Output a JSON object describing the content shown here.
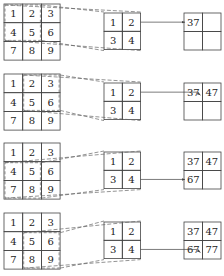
{
  "input_matrix": [
    [
      "1",
      "2",
      "3"
    ],
    [
      "4",
      "5",
      "6"
    ],
    [
      "7",
      "8",
      "9"
    ]
  ],
  "kernel": [
    [
      "1",
      "2"
    ],
    [
      "3",
      "4"
    ]
  ],
  "panels": [
    {
      "step": 1,
      "window_row": 0,
      "window_col": 0,
      "output": [
        [
          "37",
          ""
        ],
        [
          "",
          ""
        ]
      ],
      "arrow_to": [
        0,
        0
      ]
    },
    {
      "step": 2,
      "window_row": 0,
      "window_col": 1,
      "output": [
        [
          "37",
          "47"
        ],
        [
          "",
          ""
        ]
      ],
      "arrow_to": [
        0,
        0
      ]
    },
    {
      "step": 3,
      "window_row": 1,
      "window_col": 0,
      "output": [
        [
          "37",
          "47"
        ],
        [
          "67",
          ""
        ]
      ],
      "arrow_to": [
        1,
        0
      ]
    },
    {
      "step": 4,
      "window_row": 1,
      "window_col": 1,
      "output": [
        [
          "37",
          "47"
        ],
        [
          "67",
          "77"
        ]
      ],
      "arrow_to": [
        1,
        0
      ]
    }
  ],
  "colors": {
    "line": "#444444",
    "dashed": "#666666",
    "background": "#ffffff"
  }
}
